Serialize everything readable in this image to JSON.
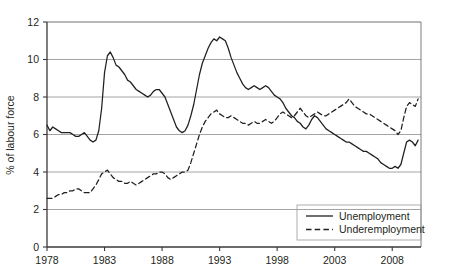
{
  "chart_data": {
    "type": "line",
    "title": "",
    "subtitle": "",
    "xlabel": "",
    "ylabel": "% of labour force",
    "xlim": [
      1978,
      2010.5
    ],
    "ylim": [
      0,
      12
    ],
    "yticks": [
      0,
      2,
      4,
      6,
      8,
      10,
      12
    ],
    "ytick_labels": [
      "0",
      "2",
      "4",
      "6",
      "8",
      "10",
      "12"
    ],
    "xticks": [
      1978,
      1983,
      1988,
      1993,
      1998,
      2003,
      2008
    ],
    "xtick_labels": [
      "1978",
      "1983",
      "1988",
      "1993",
      "1998",
      "2003",
      "2008"
    ],
    "grid": "horizontal",
    "legend_position": "bottom-right",
    "legend": [
      "Unemployment",
      "Underemployment"
    ],
    "series": [
      {
        "name": "Unemployment",
        "style": "solid",
        "color": "#231f20",
        "x": [
          1978.0,
          1978.25,
          1978.5,
          1978.75,
          1979.0,
          1979.25,
          1979.5,
          1979.75,
          1980.0,
          1980.25,
          1980.5,
          1980.75,
          1981.0,
          1981.25,
          1981.5,
          1981.75,
          1982.0,
          1982.25,
          1982.5,
          1982.75,
          1983.0,
          1983.25,
          1983.5,
          1983.75,
          1984.0,
          1984.25,
          1984.5,
          1984.75,
          1985.0,
          1985.25,
          1985.5,
          1985.75,
          1986.0,
          1986.25,
          1986.5,
          1986.75,
          1987.0,
          1987.25,
          1987.5,
          1987.75,
          1988.0,
          1988.25,
          1988.5,
          1988.75,
          1989.0,
          1989.25,
          1989.5,
          1989.75,
          1990.0,
          1990.25,
          1990.5,
          1990.75,
          1991.0,
          1991.25,
          1991.5,
          1991.75,
          1992.0,
          1992.25,
          1992.5,
          1992.75,
          1993.0,
          1993.25,
          1993.5,
          1993.75,
          1994.0,
          1994.25,
          1994.5,
          1994.75,
          1995.0,
          1995.25,
          1995.5,
          1995.75,
          1996.0,
          1996.25,
          1996.5,
          1996.75,
          1997.0,
          1997.25,
          1997.5,
          1997.75,
          1998.0,
          1998.25,
          1998.5,
          1998.75,
          1999.0,
          1999.25,
          1999.5,
          1999.75,
          2000.0,
          2000.25,
          2000.5,
          2000.75,
          2001.0,
          2001.25,
          2001.5,
          2001.75,
          2002.0,
          2002.25,
          2002.5,
          2002.75,
          2003.0,
          2003.25,
          2003.5,
          2003.75,
          2004.0,
          2004.25,
          2004.5,
          2004.75,
          2005.0,
          2005.25,
          2005.5,
          2005.75,
          2006.0,
          2006.25,
          2006.5,
          2006.75,
          2007.0,
          2007.25,
          2007.5,
          2007.75,
          2008.0,
          2008.25,
          2008.5,
          2008.75,
          2009.0,
          2009.25,
          2009.5,
          2009.75,
          2010.0,
          2010.25
        ],
        "y": [
          6.5,
          6.2,
          6.4,
          6.3,
          6.2,
          6.1,
          6.1,
          6.1,
          6.1,
          6.0,
          5.9,
          5.9,
          6.0,
          6.1,
          5.9,
          5.7,
          5.6,
          5.7,
          6.2,
          7.4,
          9.3,
          10.2,
          10.4,
          10.1,
          9.7,
          9.6,
          9.4,
          9.2,
          8.9,
          8.8,
          8.6,
          8.4,
          8.3,
          8.2,
          8.1,
          8.0,
          8.1,
          8.3,
          8.4,
          8.4,
          8.2,
          8.0,
          7.6,
          7.2,
          6.8,
          6.4,
          6.2,
          6.1,
          6.2,
          6.5,
          7.0,
          7.6,
          8.4,
          9.2,
          9.8,
          10.2,
          10.6,
          10.9,
          11.1,
          11.0,
          11.2,
          11.1,
          11.0,
          10.6,
          10.1,
          9.7,
          9.3,
          9.0,
          8.7,
          8.5,
          8.4,
          8.5,
          8.6,
          8.5,
          8.4,
          8.5,
          8.6,
          8.5,
          8.3,
          8.1,
          8.0,
          7.9,
          7.7,
          7.4,
          7.2,
          7.0,
          6.9,
          6.7,
          6.6,
          6.4,
          6.3,
          6.5,
          6.8,
          7.0,
          6.9,
          6.7,
          6.5,
          6.3,
          6.2,
          6.1,
          6.0,
          5.9,
          5.8,
          5.7,
          5.6,
          5.6,
          5.5,
          5.4,
          5.3,
          5.2,
          5.1,
          5.1,
          5.0,
          4.9,
          4.8,
          4.7,
          4.5,
          4.4,
          4.3,
          4.2,
          4.2,
          4.3,
          4.2,
          4.4,
          5.0,
          5.6,
          5.7,
          5.6,
          5.4,
          5.7
        ]
      },
      {
        "name": "Underemployment",
        "style": "dashed",
        "color": "#231f20",
        "x": [
          1978.0,
          1978.25,
          1978.5,
          1978.75,
          1979.0,
          1979.25,
          1979.5,
          1979.75,
          1980.0,
          1980.25,
          1980.5,
          1980.75,
          1981.0,
          1981.25,
          1981.5,
          1981.75,
          1982.0,
          1982.25,
          1982.5,
          1982.75,
          1983.0,
          1983.25,
          1983.5,
          1983.75,
          1984.0,
          1984.25,
          1984.5,
          1984.75,
          1985.0,
          1985.25,
          1985.5,
          1985.75,
          1986.0,
          1986.25,
          1986.5,
          1986.75,
          1987.0,
          1987.25,
          1987.5,
          1987.75,
          1988.0,
          1988.25,
          1988.5,
          1988.75,
          1989.0,
          1989.25,
          1989.5,
          1989.75,
          1990.0,
          1990.25,
          1990.5,
          1990.75,
          1991.0,
          1991.25,
          1991.5,
          1991.75,
          1992.0,
          1992.25,
          1992.5,
          1992.75,
          1993.0,
          1993.25,
          1993.5,
          1993.75,
          1994.0,
          1994.25,
          1994.5,
          1994.75,
          1995.0,
          1995.25,
          1995.5,
          1995.75,
          1996.0,
          1996.25,
          1996.5,
          1996.75,
          1997.0,
          1997.25,
          1997.5,
          1997.75,
          1998.0,
          1998.25,
          1998.5,
          1998.75,
          1999.0,
          1999.25,
          1999.5,
          1999.75,
          2000.0,
          2000.25,
          2000.5,
          2000.75,
          2001.0,
          2001.25,
          2001.5,
          2001.75,
          2002.0,
          2002.25,
          2002.5,
          2002.75,
          2003.0,
          2003.25,
          2003.5,
          2003.75,
          2004.0,
          2004.25,
          2004.5,
          2004.75,
          2005.0,
          2005.25,
          2005.5,
          2005.75,
          2006.0,
          2006.25,
          2006.5,
          2006.75,
          2007.0,
          2007.25,
          2007.5,
          2007.75,
          2008.0,
          2008.25,
          2008.5,
          2008.75,
          2009.0,
          2009.25,
          2009.5,
          2009.75,
          2010.0,
          2010.25
        ],
        "y": [
          2.6,
          2.6,
          2.6,
          2.7,
          2.8,
          2.8,
          2.9,
          2.9,
          3.0,
          3.0,
          3.1,
          3.1,
          3.0,
          2.9,
          2.9,
          2.9,
          3.1,
          3.3,
          3.6,
          3.9,
          4.0,
          4.1,
          3.9,
          3.7,
          3.6,
          3.5,
          3.5,
          3.4,
          3.4,
          3.5,
          3.4,
          3.3,
          3.4,
          3.5,
          3.6,
          3.7,
          3.8,
          3.9,
          3.9,
          4.0,
          4.0,
          3.9,
          3.7,
          3.6,
          3.7,
          3.8,
          3.9,
          4.0,
          4.0,
          4.1,
          4.5,
          5.0,
          5.5,
          6.0,
          6.4,
          6.7,
          6.9,
          7.1,
          7.2,
          7.3,
          7.1,
          7.0,
          6.9,
          6.9,
          7.0,
          6.9,
          6.8,
          6.7,
          6.6,
          6.6,
          6.5,
          6.6,
          6.7,
          6.6,
          6.6,
          6.7,
          6.8,
          6.7,
          6.6,
          6.7,
          6.9,
          7.1,
          7.2,
          7.1,
          7.0,
          6.9,
          7.0,
          7.2,
          7.4,
          7.2,
          7.0,
          6.9,
          7.0,
          7.1,
          7.2,
          7.1,
          7.0,
          7.0,
          7.1,
          7.2,
          7.3,
          7.4,
          7.5,
          7.6,
          7.7,
          7.9,
          7.7,
          7.5,
          7.4,
          7.3,
          7.2,
          7.1,
          7.1,
          7.0,
          6.9,
          6.8,
          6.7,
          6.6,
          6.5,
          6.4,
          6.3,
          6.2,
          6.0,
          6.2,
          6.9,
          7.5,
          7.7,
          7.6,
          7.5,
          7.9
        ]
      }
    ]
  }
}
